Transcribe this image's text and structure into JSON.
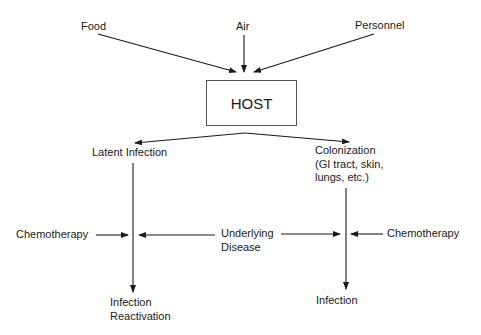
{
  "diagram": {
    "sources": {
      "food": "Food",
      "air": "Air",
      "personnel": "Personnel"
    },
    "host": "HOST",
    "branches": {
      "latent_infection": "Latent Infection",
      "colonization": [
        "Colonization",
        "(GI tract, skin,",
        "lungs, etc.)"
      ]
    },
    "modifiers": {
      "chemotherapy_left": "Chemotherapy",
      "underlying_disease": [
        "Underlying",
        "Disease"
      ],
      "chemotherapy_right": "Chemotherapy"
    },
    "outcomes": {
      "infection_reactivation": [
        "Infection",
        "Reactivation"
      ],
      "infection": "Infection"
    },
    "colors": {
      "ink": "#1a1a1a",
      "background": "#ffffff"
    }
  }
}
